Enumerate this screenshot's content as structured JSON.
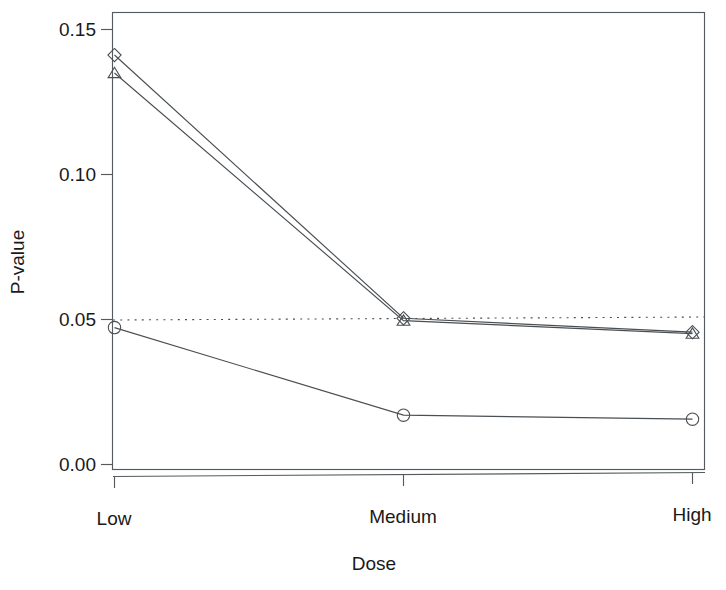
{
  "chart_data": {
    "type": "line",
    "title": "",
    "xlabel": "Dose",
    "ylabel": "P-value",
    "categories": [
      "Low",
      "Medium",
      "High"
    ],
    "ytick_labels": [
      "0.00",
      "0.05",
      "0.10",
      "0.15"
    ],
    "ytick_values": [
      0.0,
      0.05,
      0.1,
      0.15
    ],
    "ylim": [
      0.0,
      0.1572
    ],
    "grid": false,
    "legend": "none",
    "annotations": [
      {
        "name": "significance-threshold",
        "type": "horizontal-reference-line",
        "value": 0.05,
        "style": "dotted"
      }
    ],
    "series": [
      {
        "name": "series-diamond",
        "marker": "diamond",
        "values": [
          0.1412,
          0.05,
          0.0448
        ]
      },
      {
        "name": "series-triangle",
        "marker": "triangle",
        "values": [
          0.135,
          0.0492,
          0.0443
        ]
      },
      {
        "name": "series-circle",
        "marker": "circle",
        "values": [
          0.0472,
          0.0166,
          0.0148
        ]
      }
    ]
  },
  "colors": {
    "line": "#4a4f53",
    "border": "#555a5e",
    "text": "#1a1a1a",
    "background": "#ffffff"
  }
}
